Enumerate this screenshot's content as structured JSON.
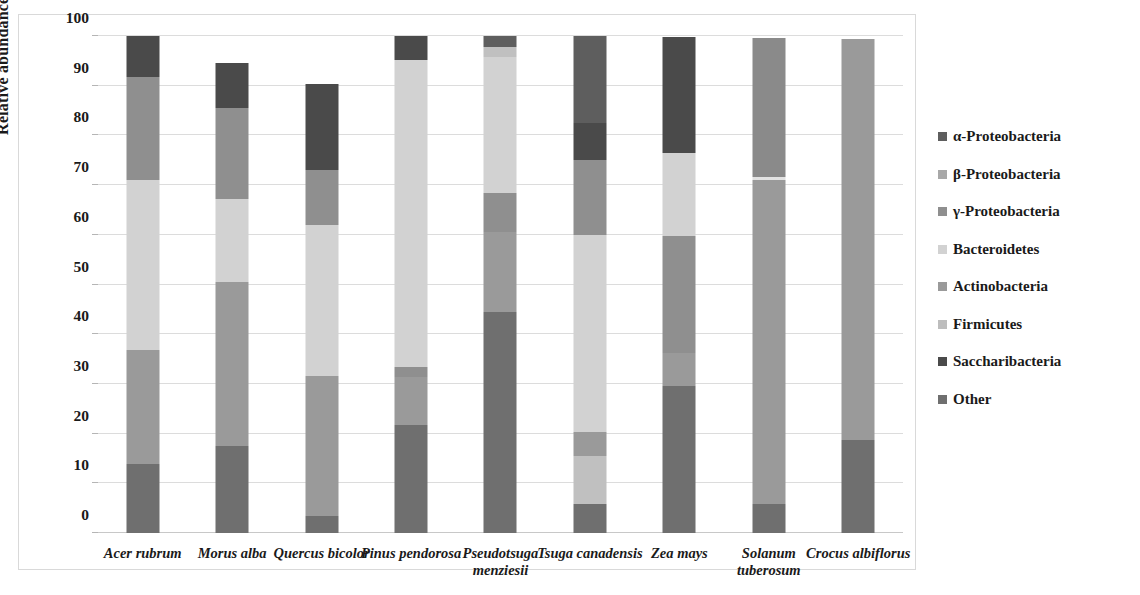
{
  "chart_data": {
    "type": "bar",
    "subtype": "stacked-bar-100-percent",
    "title": "",
    "xlabel": "",
    "ylabel": "Relative abundance (%)",
    "ylim": [
      0,
      100
    ],
    "yticks": [
      0,
      10,
      20,
      30,
      40,
      50,
      60,
      70,
      80,
      90,
      100
    ],
    "grid": true,
    "legend_position": "right",
    "categories": [
      "Acer rubrum",
      "Morus alba",
      "Quercus bicolor",
      "Pinus pendorosa",
      "Pseudotsuga menziesii",
      "Tsuga canadensis",
      "Zea mays",
      "Solanum tuberosum",
      "Crocus albiflorus"
    ],
    "series": [
      {
        "name": "α-Proteobacteria",
        "color": "#5e5e5e",
        "values": [
          0.0,
          0.0,
          0.0,
          0.0,
          2.2,
          17.5,
          0.0,
          0.0,
          0.0
        ]
      },
      {
        "name": "β-Proteobacteria",
        "color": "#a3a3a3",
        "values": [
          0.0,
          0.0,
          0.0,
          0.0,
          0.0,
          0.0,
          0.0,
          0.0,
          0.0
        ]
      },
      {
        "name": "γ-Proteobacteria",
        "color": "#8f8f8f",
        "values": [
          20.8,
          18.3,
          11.0,
          2.1,
          8.0,
          15.0,
          23.5,
          0.0,
          0.0
        ]
      },
      {
        "name": "Bacteroidetes",
        "color": "#d2d2d2",
        "values": [
          34.2,
          16.8,
          30.5,
          61.7,
          28.0,
          39.7,
          16.7,
          0.0,
          0.0
        ]
      },
      {
        "name": "Actinobacteria",
        "color": "#9a9a9a",
        "values": [
          23.0,
          33.0,
          28.0,
          9.6,
          16.0,
          4.8,
          6.6,
          65.2,
          80.8
        ]
      },
      {
        "name": "Firmicutes",
        "color": "#c0c0c0",
        "values": [
          0.0,
          0.0,
          0.0,
          0.0,
          1.8,
          9.6,
          0.0,
          0.6,
          0.0
        ]
      },
      {
        "name": "Saccharibacteria",
        "color": "#4a4a4a",
        "values": [
          8.2,
          8.9,
          17.4,
          4.8,
          2.2,
          7.5,
          23.5,
          28.0,
          0.0
        ]
      },
      {
        "name": "Other",
        "color": "#6f6f6f",
        "values": [
          13.8,
          17.5,
          3.5,
          21.8,
          44.5,
          5.8,
          29.6,
          5.8,
          18.7
        ]
      }
    ],
    "bar_totals": [
      100.0,
      94.5,
      90.4,
      100.0,
      102.7,
      99.9,
      99.9,
      99.6,
      99.5
    ],
    "stack_order_bottom_to_top": [
      "Other",
      "Saccharibacteria",
      "Firmicutes",
      "Actinobacteria",
      "Bacteroidetes",
      "γ-Proteobacteria",
      "β-Proteobacteria",
      "α-Proteobacteria"
    ],
    "stacks": [
      {
        "category": "Acer rubrum",
        "segments": [
          {
            "series": "Other",
            "from": 0.0,
            "to": 13.8,
            "color": "#6f6f6f"
          },
          {
            "series": "Actinobacteria",
            "from": 13.8,
            "to": 36.8,
            "color": "#9a9a9a"
          },
          {
            "series": "Bacteroidetes",
            "from": 36.8,
            "to": 71.0,
            "color": "#d2d2d2"
          },
          {
            "series": "γ-Proteobacteria",
            "from": 71.0,
            "to": 91.8,
            "color": "#8f8f8f"
          },
          {
            "series": "Saccharibacteria",
            "from": 91.8,
            "to": 100.0,
            "color": "#4a4a4a"
          }
        ]
      },
      {
        "category": "Morus alba",
        "segments": [
          {
            "series": "Other",
            "from": 0.0,
            "to": 17.5,
            "color": "#6f6f6f"
          },
          {
            "series": "Actinobacteria",
            "from": 17.5,
            "to": 50.5,
            "color": "#9a9a9a"
          },
          {
            "series": "Bacteroidetes",
            "from": 50.5,
            "to": 67.3,
            "color": "#d2d2d2"
          },
          {
            "series": "γ-Proteobacteria",
            "from": 67.3,
            "to": 85.6,
            "color": "#8f8f8f"
          },
          {
            "series": "Saccharibacteria",
            "from": 85.6,
            "to": 94.5,
            "color": "#4a4a4a"
          }
        ]
      },
      {
        "category": "Quercus bicolor",
        "segments": [
          {
            "series": "Other",
            "from": 0.0,
            "to": 3.5,
            "color": "#6f6f6f"
          },
          {
            "series": "Actinobacteria",
            "from": 3.5,
            "to": 31.5,
            "color": "#9a9a9a"
          },
          {
            "series": "Bacteroidetes",
            "from": 31.5,
            "to": 62.0,
            "color": "#d2d2d2"
          },
          {
            "series": "γ-Proteobacteria",
            "from": 62.0,
            "to": 73.0,
            "color": "#8f8f8f"
          },
          {
            "series": "Saccharibacteria",
            "from": 73.0,
            "to": 90.4,
            "color": "#4a4a4a"
          }
        ]
      },
      {
        "category": "Pinus pendorosa",
        "segments": [
          {
            "series": "Other",
            "from": 0.0,
            "to": 21.8,
            "color": "#6f6f6f"
          },
          {
            "series": "Actinobacteria",
            "from": 21.8,
            "to": 31.4,
            "color": "#9a9a9a"
          },
          {
            "series": "γ-Proteobacteria",
            "from": 31.4,
            "to": 33.5,
            "color": "#8f8f8f"
          },
          {
            "series": "Bacteroidetes",
            "from": 33.5,
            "to": 95.2,
            "color": "#d2d2d2"
          },
          {
            "series": "Saccharibacteria",
            "from": 95.2,
            "to": 100.0,
            "color": "#4a4a4a"
          }
        ]
      },
      {
        "category": "Pseudotsuga menziesii",
        "segments": [
          {
            "series": "Other",
            "from": 0.0,
            "to": 44.5,
            "color": "#6f6f6f"
          },
          {
            "series": "Actinobacteria",
            "from": 44.5,
            "to": 60.5,
            "color": "#9a9a9a"
          },
          {
            "series": "γ-Proteobacteria",
            "from": 60.5,
            "to": 68.5,
            "color": "#8f8f8f"
          },
          {
            "series": "Bacteroidetes",
            "from": 68.5,
            "to": 95.7,
            "color": "#d2d2d2"
          },
          {
            "series": "Firmicutes",
            "from": 95.7,
            "to": 97.8,
            "color": "#c0c0c0"
          },
          {
            "series": "α-Proteobacteria",
            "from": 97.8,
            "to": 100.0,
            "color": "#5e5e5e"
          }
        ]
      },
      {
        "category": "Tsuga canadensis",
        "segments": [
          {
            "series": "Other",
            "from": 0.0,
            "to": 5.8,
            "color": "#6f6f6f"
          },
          {
            "series": "Firmicutes",
            "from": 5.8,
            "to": 15.4,
            "color": "#c0c0c0"
          },
          {
            "series": "Actinobacteria",
            "from": 15.4,
            "to": 20.3,
            "color": "#9a9a9a"
          },
          {
            "series": "Bacteroidetes",
            "from": 20.3,
            "to": 60.0,
            "color": "#d2d2d2"
          },
          {
            "series": "γ-Proteobacteria",
            "from": 60.0,
            "to": 75.0,
            "color": "#8f8f8f"
          },
          {
            "series": "Saccharibacteria",
            "from": 75.0,
            "to": 82.5,
            "color": "#4a4a4a"
          },
          {
            "series": "α-Proteobacteria",
            "from": 82.5,
            "to": 100.0,
            "color": "#5e5e5e"
          }
        ]
      },
      {
        "category": "Zea mays",
        "segments": [
          {
            "series": "Other",
            "from": 0.0,
            "to": 29.6,
            "color": "#6f6f6f"
          },
          {
            "series": "Actinobacteria",
            "from": 29.6,
            "to": 36.2,
            "color": "#9a9a9a"
          },
          {
            "series": "γ-Proteobacteria",
            "from": 36.2,
            "to": 59.8,
            "color": "#8f8f8f"
          },
          {
            "series": "Bacteroidetes",
            "from": 59.8,
            "to": 76.5,
            "color": "#d2d2d2"
          },
          {
            "series": "Saccharibacteria",
            "from": 76.5,
            "to": 99.9,
            "color": "#4a4a4a"
          }
        ]
      },
      {
        "category": "Solanum tuberosum",
        "segments": [
          {
            "series": "Other",
            "from": 0.0,
            "to": 5.8,
            "color": "#6f6f6f"
          },
          {
            "series": "Actinobacteria",
            "from": 5.8,
            "to": 71.0,
            "color": "#9a9a9a"
          },
          {
            "series": "Firmicutes",
            "from": 71.0,
            "to": 71.6,
            "color": "#e2e2e2"
          },
          {
            "series": "Saccharibacteria",
            "from": 71.6,
            "to": 99.6,
            "color": "#8a8a8a"
          }
        ]
      },
      {
        "category": "Crocus albiflorus",
        "segments": [
          {
            "series": "Other",
            "from": 0.0,
            "to": 18.7,
            "color": "#6f6f6f"
          },
          {
            "series": "Actinobacteria",
            "from": 18.7,
            "to": 99.5,
            "color": "#9a9a9a"
          }
        ]
      }
    ],
    "legend": [
      {
        "label": "α-Proteobacteria",
        "color": "#5e5e5e"
      },
      {
        "label": "β-Proteobacteria",
        "color": "#a8a8a8"
      },
      {
        "label": "γ-Proteobacteria",
        "color": "#8f8f8f"
      },
      {
        "label": "Bacteroidetes",
        "color": "#d2d2d2"
      },
      {
        "label": "Actinobacteria",
        "color": "#9a9a9a"
      },
      {
        "label": "Firmicutes",
        "color": "#bdbdbd"
      },
      {
        "label": "Saccharibacteria",
        "color": "#4a4a4a"
      },
      {
        "label": "Other",
        "color": "#6f6f6f"
      }
    ]
  },
  "caption": ""
}
